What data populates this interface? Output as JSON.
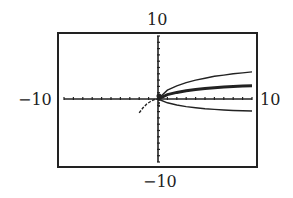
{
  "chart_data": {
    "type": "line",
    "title": "",
    "xlabel": "",
    "ylabel": "",
    "xlim": [
      -10,
      10
    ],
    "ylim": [
      -10,
      10
    ],
    "window_labels": {
      "top": "10",
      "bottom": "-10",
      "left": "-10",
      "right": "10"
    },
    "tick_spacing": 1,
    "grid": false,
    "series": [
      {
        "name": "upper-curve",
        "x": [
          0,
          1,
          2,
          3,
          4,
          5,
          6,
          7,
          8,
          9,
          10
        ],
        "y": [
          0,
          1.4,
          2.1,
          2.6,
          3.0,
          3.3,
          3.6,
          3.8,
          4.0,
          4.15,
          4.3
        ],
        "style": "thin"
      },
      {
        "name": "middle-curve",
        "x": [
          0,
          1,
          2,
          3,
          4,
          5,
          6,
          7,
          8,
          9,
          10
        ],
        "y": [
          0,
          0.7,
          1.05,
          1.3,
          1.5,
          1.65,
          1.8,
          1.9,
          2.0,
          2.05,
          2.1
        ],
        "style": "thick"
      },
      {
        "name": "lower-curve",
        "x": [
          0,
          1,
          2,
          3,
          4,
          5,
          6,
          7,
          8,
          9,
          10
        ],
        "y": [
          0,
          -0.6,
          -0.95,
          -1.2,
          -1.4,
          -1.55,
          -1.65,
          -1.75,
          -1.82,
          -1.87,
          -1.9
        ],
        "style": "thin"
      },
      {
        "name": "left-branch",
        "x": [
          -2,
          -1.6,
          -1.2,
          -0.8,
          -0.4,
          0
        ],
        "y": [
          -2.2,
          -1.4,
          -0.8,
          -0.4,
          -0.1,
          0
        ],
        "style": "dashed"
      }
    ]
  }
}
